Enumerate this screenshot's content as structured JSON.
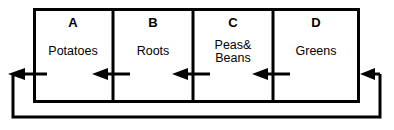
{
  "diagram": {
    "type": "crop-rotation-cycle",
    "line_color": "#000000",
    "background_color": "#ffffff",
    "cells": [
      {
        "letter": "A",
        "label": "Potatoes",
        "label_lines": [
          "Potatoes"
        ]
      },
      {
        "letter": "B",
        "label": "Roots",
        "label_lines": [
          "Roots"
        ]
      },
      {
        "letter": "C",
        "label": "Peas&Beans",
        "label_lines": [
          "Peas&",
          "Beans"
        ]
      },
      {
        "letter": "D",
        "label": "Greens",
        "label_lines": [
          "Greens"
        ]
      }
    ],
    "flow": {
      "direction": "right-to-left",
      "loops_back": true,
      "arrow_count": 5,
      "description": "D to C to B to A, then loops around from A back to D"
    }
  },
  "geometry": {
    "box": {
      "x": 33,
      "y": 8,
      "width": 327,
      "height": 95
    },
    "dividers_x": [
      113,
      193,
      273
    ],
    "arrow_row_y": 74,
    "loop_left_x": 13,
    "loop_right_x": 380,
    "loop_bottom_y": 117,
    "border_width": 3,
    "divider_width": 3,
    "arrow_stroke_width": 3
  }
}
